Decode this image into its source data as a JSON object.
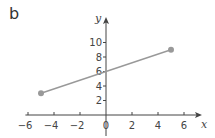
{
  "panel_label": "b",
  "chart_data": {
    "type": "line",
    "title": "",
    "panel": "b",
    "xlabel": "x",
    "ylabel": "y",
    "xlim": [
      -6.5,
      7.2
    ],
    "ylim": [
      0,
      13
    ],
    "x_ticks": [
      -6,
      -4,
      -2,
      0,
      2,
      4,
      6
    ],
    "y_ticks": [
      2,
      4,
      6,
      8,
      10
    ],
    "grid": false,
    "legend": null,
    "series": [
      {
        "name": "segment",
        "x": [
          -5,
          5
        ],
        "y": [
          3,
          9
        ],
        "color": "#999999",
        "markers": "circle"
      }
    ]
  },
  "colors": {
    "axis": "#444444",
    "line": "#999999",
    "marker": "#999999",
    "text": "#444444"
  }
}
